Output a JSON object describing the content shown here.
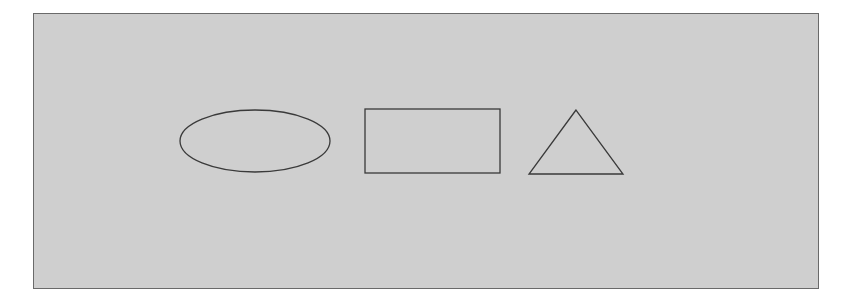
{
  "diagram": {
    "background_color": "#cfcfcf",
    "border_color": "#6a6a6a",
    "stroke_color": "#3a3a3a",
    "shapes": [
      {
        "type": "ellipse",
        "cx": 255,
        "cy": 141,
        "rx": 75,
        "ry": 31
      },
      {
        "type": "rectangle",
        "x": 365,
        "y": 109,
        "width": 135,
        "height": 64
      },
      {
        "type": "triangle",
        "points": "576,110 529,174 623,174"
      }
    ]
  }
}
